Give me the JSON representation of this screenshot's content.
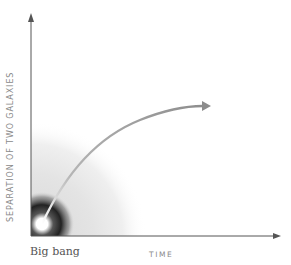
{
  "diagram": {
    "y_axis_label": "SEPARATION OF TWO GALAXIES",
    "x_axis_label": "TIME",
    "origin_label": "Big bang",
    "colors": {
      "axis": "#555555",
      "curve": "#8c8c8c",
      "label": "#8a8a8a",
      "glow_core": "#ffffff",
      "glow_dark": "#222222",
      "glow_halo": "#e6e6e6"
    }
  }
}
